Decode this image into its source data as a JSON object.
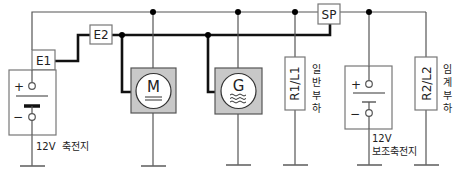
{
  "diagram": {
    "connectors": {
      "e1": "E1",
      "e2": "E2",
      "sp": "SP"
    },
    "motor": {
      "symbol": "M",
      "icon": "motor-icon"
    },
    "generator": {
      "symbol": "G",
      "icon": "generator-icon"
    },
    "load1": {
      "code": "R1/L1",
      "chars": [
        "일",
        "반",
        "부",
        "하"
      ]
    },
    "load2": {
      "code": "R2/L2",
      "chars": [
        "임",
        "계",
        "부",
        "하"
      ]
    },
    "battery_main": {
      "plus": "+",
      "minus": "−",
      "label": "12V  축전지"
    },
    "battery_aux": {
      "plus": "+",
      "minus": "−",
      "label_line1": "12V",
      "label_line2": "보조축전지"
    },
    "colors": {
      "component_fill": "#c8c8c8",
      "line": "#555555",
      "bus": "#111111"
    }
  }
}
